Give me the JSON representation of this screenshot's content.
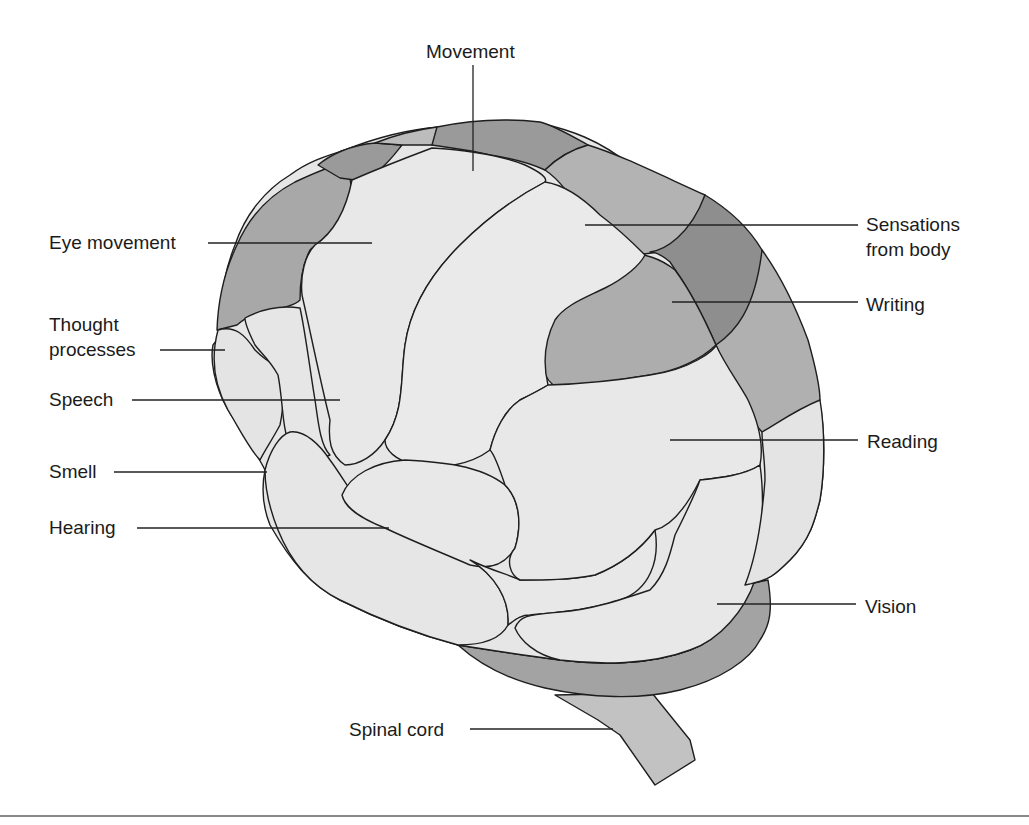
{
  "diagram": {
    "colors": {
      "light_region": "#e6e6e6",
      "medium_region": "#b0b0b0",
      "dark_region": "#959595",
      "darker_region": "#8a8a8a",
      "outline": "#1e1e1e",
      "bottom_rule": "#8a8a8a"
    },
    "labels": [
      {
        "id": "movement",
        "text": "Movement",
        "side": "top"
      },
      {
        "id": "eye-movement",
        "text": "Eye movement",
        "side": "left"
      },
      {
        "id": "thought-processes",
        "line1": "Thought",
        "line2": "processes",
        "side": "left"
      },
      {
        "id": "speech",
        "text": "Speech",
        "side": "left"
      },
      {
        "id": "smell",
        "text": "Smell",
        "side": "left"
      },
      {
        "id": "hearing",
        "text": "Hearing",
        "side": "left"
      },
      {
        "id": "sensations-from-body",
        "line1": "Sensations",
        "line2": "from body",
        "side": "right"
      },
      {
        "id": "writing",
        "text": "Writing",
        "side": "right"
      },
      {
        "id": "reading",
        "text": "Reading",
        "side": "right"
      },
      {
        "id": "vision",
        "text": "Vision",
        "side": "right"
      },
      {
        "id": "spinal-cord",
        "text": "Spinal cord",
        "side": "bottom"
      }
    ]
  }
}
